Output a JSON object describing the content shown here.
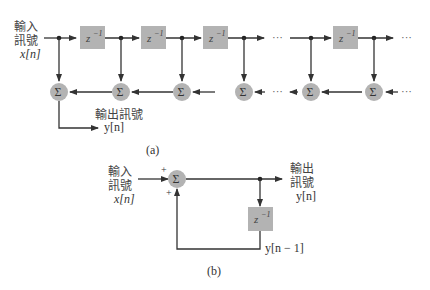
{
  "diagram_a": {
    "input_label_line1": "輸入",
    "input_label_line2": "訊號",
    "input_signal": "x[n]",
    "delay_label": "z",
    "delay_exp": "−1",
    "sum_symbol": "Σ",
    "output_label": "輸出訊號",
    "output_signal": "y[n]",
    "ellipsis": "···",
    "caption": "(a)"
  },
  "diagram_b": {
    "input_label_line1": "輸入",
    "input_label_line2": "訊號",
    "input_signal": "x[n]",
    "plus_top": "+",
    "plus_bottom": "+",
    "sum_symbol": "Σ",
    "output_label_line1": "輸出",
    "output_label_line2": "訊號",
    "output_signal": "y[n]",
    "delay_label": "z",
    "delay_exp": "−1",
    "feedback_signal": "y[n − 1]",
    "caption": "(b)"
  },
  "colors": {
    "block_fill": "#b3b3b3",
    "line": "#333333",
    "background": "#ffffff"
  }
}
